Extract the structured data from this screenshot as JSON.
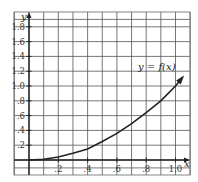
{
  "chart_data": {
    "type": "line",
    "title": "",
    "xlabel": "x",
    "ylabel": "y",
    "xlim": [
      -0.1,
      1.1
    ],
    "ylim": [
      -0.1,
      1.9
    ],
    "grid": true,
    "x_ticks": [
      ".2",
      ".4",
      ".6",
      ".8",
      "1.0"
    ],
    "y_ticks": [
      ".2",
      ".4",
      ".6",
      ".8",
      "1.0",
      "1.2",
      "1.4",
      "1.6",
      "1.8"
    ],
    "series": [
      {
        "name": "y = f(x)",
        "x": [
          0,
          0.1,
          0.2,
          0.3,
          0.4,
          0.5,
          0.6,
          0.7,
          0.8,
          0.9,
          1.0,
          1.05
        ],
        "values": [
          0,
          0.01,
          0.04,
          0.09,
          0.15,
          0.25,
          0.36,
          0.49,
          0.64,
          0.8,
          1.0,
          1.12
        ]
      }
    ],
    "annotations": [
      "y = f(x)"
    ]
  },
  "labels": {
    "curve": "y = f(x)",
    "x_axis": "x",
    "y_axis": "y"
  }
}
